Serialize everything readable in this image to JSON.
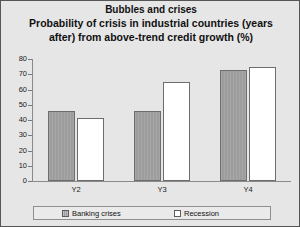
{
  "chart_data": {
    "type": "bar",
    "title": "Bubbles and crises",
    "subtitle": "Probability of crisis in industrial countries (years after) from above-trend credit growth (%)",
    "subtitle_line1": "Probability of crisis in industrial countries (years",
    "subtitle_line2": "after) from above-trend credit growth (%)",
    "categories": [
      "Y2",
      "Y3",
      "Y4"
    ],
    "series": [
      {
        "name": "Banking crises",
        "values": [
          46,
          46,
          73
        ],
        "color": "#9d9d9d"
      },
      {
        "name": "Recession",
        "values": [
          41,
          65,
          75
        ],
        "color": "#ffffff"
      }
    ],
    "xlabel": "",
    "ylabel": "",
    "ylim": [
      0,
      80
    ],
    "y_ticks": [
      0,
      10,
      20,
      30,
      40,
      50,
      60,
      70,
      80
    ],
    "y_tick_labels": [
      "0",
      "10",
      "20",
      "30",
      "40",
      "50",
      "60",
      "70",
      "80"
    ],
    "grid": false,
    "legend_position": "bottom"
  }
}
